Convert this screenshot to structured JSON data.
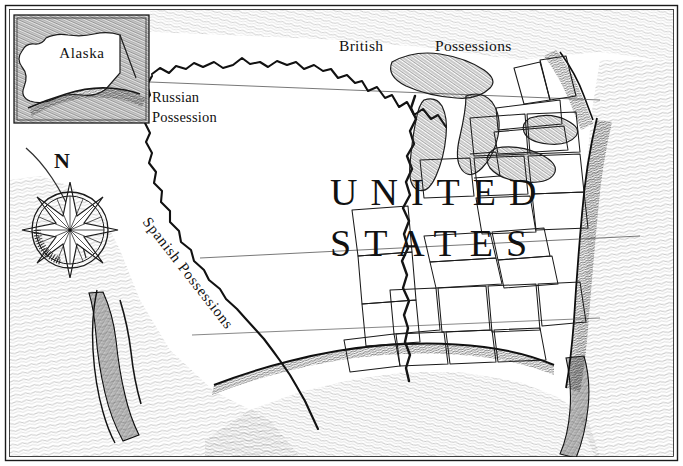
{
  "map": {
    "title_line1": "UNITED",
    "title_line2": "STATES",
    "inset_label": "Alaska",
    "labels": {
      "russian_line1": "Russian",
      "russian_line2": "Possession",
      "british_word1": "British",
      "british_word2": "Possessions",
      "spanish": "Spanish Possessions",
      "compass_north": "N"
    },
    "colors": {
      "ink": "#111111",
      "paper": "#ffffff",
      "hachure": "#2b2b2b",
      "border": "#1a1a1a",
      "line_light": "#555555"
    },
    "style": {
      "medium": "pen-and-ink engraving",
      "frame": "double-rule rectangular border"
    }
  }
}
